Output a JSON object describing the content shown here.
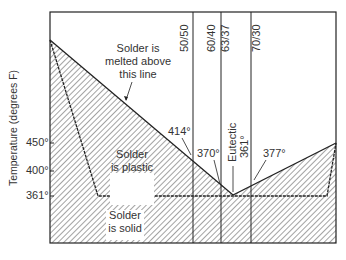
{
  "diagram": {
    "y_axis_label": "Temperature (degrees F)",
    "y_ticks": [
      "450°",
      "400°",
      "361°"
    ],
    "alloys": [
      "50/50",
      "60/40",
      "63/37",
      "70/30"
    ],
    "regions": {
      "melted": [
        "Solder is",
        "melted above",
        "this line"
      ],
      "plastic": [
        "Solder",
        "is plastic"
      ],
      "solid": [
        "Solder",
        "is solid"
      ]
    },
    "annotations": {
      "t414": "414°",
      "t370": "370°",
      "eutectic": "Eutectic",
      "eutectic_temp": "361°",
      "t377": "377°"
    },
    "colors": {
      "line": "#222222",
      "hatch": "#555555",
      "background": "#ffffff"
    }
  }
}
